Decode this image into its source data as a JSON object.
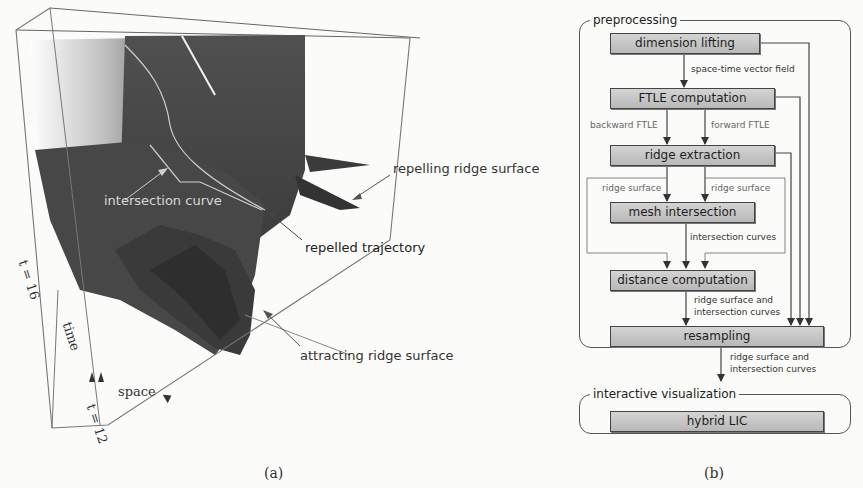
{
  "panel_a": {
    "caption": "(a)",
    "labels": {
      "intersection_curve": "intersection curve",
      "repelling_ridge_surface": "repelling ridge surface",
      "repelled_trajectory": "repelled trajectory",
      "attracting_ridge_surface": "attracting ridge surface",
      "t16": "t = 16",
      "time": "time",
      "space": "space",
      "t12": "t = 12"
    }
  },
  "panel_b": {
    "caption": "(b)",
    "groups": {
      "preprocessing": "preprocessing",
      "interactive_visualization": "interactive visualization"
    },
    "nodes": {
      "dimension_lifting": "dimension lifting",
      "ftle_computation": "FTLE computation",
      "ridge_extraction": "ridge extraction",
      "mesh_intersection": "mesh intersection",
      "distance_computation": "distance computation",
      "resampling": "resampling",
      "hybrid_lic": "hybrid LIC"
    },
    "edges": {
      "space_time_vector_field": "space-time vector field",
      "backward_ftle": "backward FTLE",
      "forward_ftle": "forward FTLE",
      "ridge_surface_left": "ridge surface",
      "ridge_surface_right": "ridge surface",
      "intersection_curves": "intersection curves",
      "ridge_surface_and_1": "ridge surface and",
      "intersection_curves_1": "intersection curves",
      "ridge_surface_and_2": "ridge surface and",
      "intersection_curves_2": "intersection curves"
    }
  },
  "colors": {
    "surface_dark": "#4a4a4a",
    "box_fill": "#c4c4c4",
    "line": "#444444"
  }
}
